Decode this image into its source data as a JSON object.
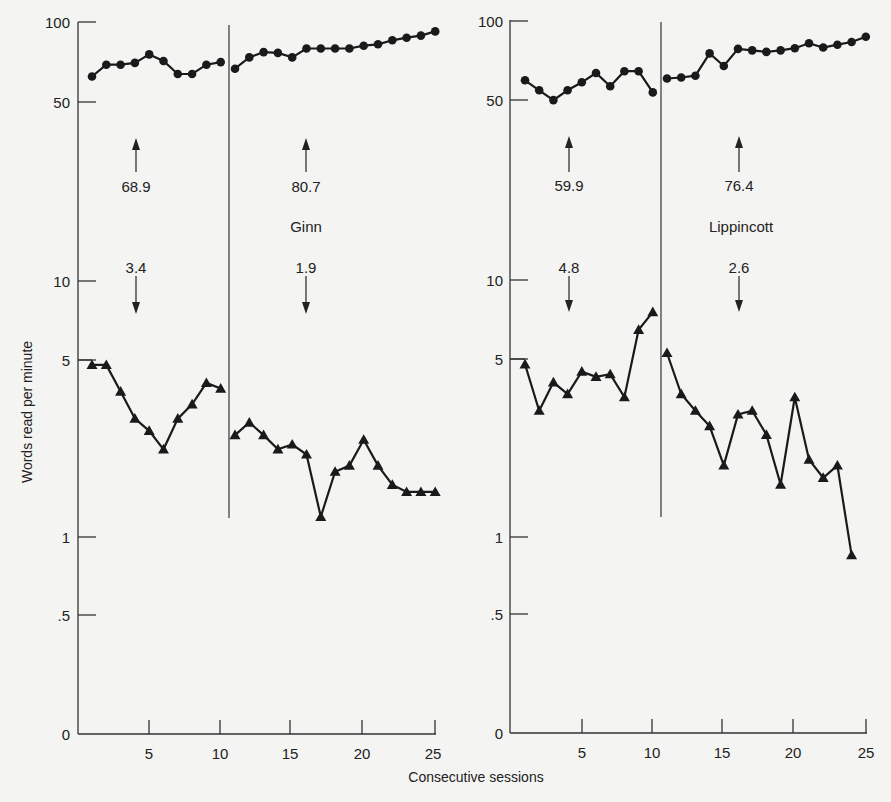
{
  "chart_data": {
    "type": "line",
    "xlabel": "Consecutive sessions",
    "ylabel": "Words read per minute",
    "yscale": "log",
    "y_ticks": [
      "100",
      "50",
      "10",
      "5",
      "1",
      ".5",
      "0"
    ],
    "x_ticks": [
      "5",
      "10",
      "15",
      "20",
      "25"
    ],
    "grid": false,
    "panels": [
      {
        "name": "Ginn",
        "label": "Ginn",
        "phase_change_after_session": 10.5,
        "annotations": {
          "correct_phase1_mean": "68.9",
          "correct_phase2_mean": "80.7",
          "error_phase1_mean": "3.4",
          "error_phase2_mean": "1.9"
        },
        "x": [
          1,
          2,
          3,
          4,
          5,
          6,
          7,
          8,
          9,
          10,
          11,
          12,
          13,
          14,
          15,
          16,
          17,
          18,
          19,
          20,
          21,
          22,
          23,
          24,
          25
        ],
        "series": [
          {
            "name": "Correct words per minute",
            "marker": "circle",
            "values": [
              61.6,
              68.4,
              68.4,
              69.5,
              75,
              70.7,
              63,
              63,
              68.4,
              70,
              66,
              73,
              76.5,
              76,
              73,
              79,
              79,
              79,
              79,
              81,
              82,
              85,
              87,
              88.6,
              92
            ]
          },
          {
            "name": "Errors per minute",
            "marker": "triangle",
            "values": [
              4.7,
              4.7,
              3.7,
              2.9,
              2.6,
              2.2,
              2.9,
              3.3,
              4.0,
              3.8,
              2.5,
              2.8,
              2.5,
              2.2,
              2.3,
              2.1,
              1.2,
              1.8,
              1.9,
              2.4,
              1.9,
              1.6,
              1.5,
              1.5,
              1.5
            ]
          }
        ]
      },
      {
        "name": "Lippincott",
        "label": "Lippincott",
        "phase_change_after_session": 10.5,
        "annotations": {
          "correct_phase1_mean": "59.9",
          "correct_phase2_mean": "76.4",
          "error_phase1_mean": "4.8",
          "error_phase2_mean": "2.6"
        },
        "x": [
          1,
          2,
          3,
          4,
          5,
          6,
          7,
          8,
          9,
          10,
          11,
          12,
          13,
          14,
          15,
          16,
          17,
          18,
          19,
          20,
          21,
          22,
          23,
          24,
          25
        ],
        "series": [
          {
            "name": "Correct words per minute",
            "marker": "circle",
            "values": [
              59,
              54,
              49.5,
              54,
              58,
              63,
              56,
              64,
              64,
              53,
              60,
              60.5,
              61.5,
              75,
              67,
              78,
              77,
              76,
              77,
              78.5,
              82,
              79,
              81,
              83,
              87
            ]
          },
          {
            "name": "Errors per minute",
            "marker": "triangle",
            "values": [
              4.7,
              3.1,
              4.0,
              3.6,
              4.4,
              4.2,
              4.3,
              3.5,
              6.4,
              7.5,
              5.2,
              3.6,
              3.1,
              2.7,
              1.9,
              3.0,
              3.1,
              2.5,
              1.6,
              3.5,
              2.0,
              1.7,
              1.9,
              0.85,
              null
            ]
          }
        ]
      }
    ]
  },
  "labels": {
    "ylabel": "Words read per minute",
    "xlabel": "Consecutive sessions",
    "y_ticks": [
      "100",
      "50",
      "10",
      "5",
      "1",
      ".5",
      "0"
    ],
    "x_ticks": [
      "5",
      "10",
      "15",
      "20",
      "25"
    ],
    "left": {
      "name": "Ginn",
      "up1": "68.9",
      "up2": "80.7",
      "down1": "3.4",
      "down2": "1.9"
    },
    "right": {
      "name": "Lippincott",
      "up1": "59.9",
      "up2": "76.4",
      "down1": "4.8",
      "down2": "2.6"
    }
  },
  "style": {
    "ink": "#1a1a1a",
    "axis": "#333333",
    "background": "#f4f4f2"
  }
}
